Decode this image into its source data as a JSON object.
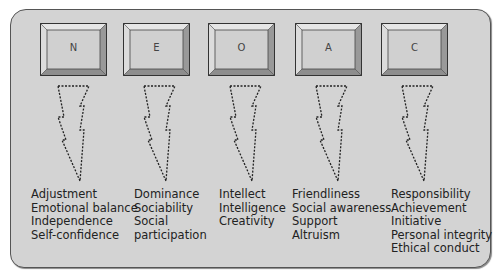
{
  "diagram": {
    "title": "",
    "colors": {
      "panel": "#d3d3d3",
      "border": "#555555",
      "key_face": "#d0d0d0",
      "text": "#222222"
    },
    "factors": [
      {
        "key": "N",
        "traits": [
          "Adjustment",
          "Emotional balance",
          "Independence",
          "Self-confidence"
        ]
      },
      {
        "key": "E",
        "traits": [
          "Dominance",
          "Sociability",
          "Social",
          "participation"
        ]
      },
      {
        "key": "O",
        "traits": [
          "Intellect",
          "Intelligence",
          "Creativity"
        ]
      },
      {
        "key": "A",
        "traits": [
          "Friendliness",
          "Social awareness",
          "Support",
          "Altruism"
        ]
      },
      {
        "key": "C",
        "traits": [
          "Responsibility",
          "Achievement",
          "Initiative",
          "Personal integrity",
          "Ethical conduct"
        ]
      }
    ]
  }
}
